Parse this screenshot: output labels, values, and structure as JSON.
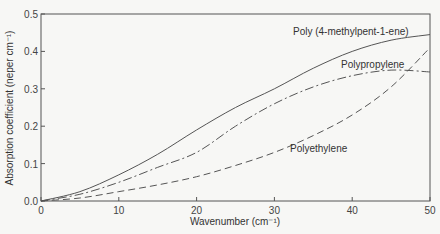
{
  "chart_data": {
    "type": "line",
    "title": "",
    "xlabel": "Wavenumber (cm⁻¹)",
    "ylabel": "Absorption coefficient (neper cm⁻¹)",
    "xlim": [
      0,
      50
    ],
    "ylim": [
      0,
      0.5
    ],
    "xticks": [
      "0",
      "10",
      "20",
      "30",
      "40",
      "50"
    ],
    "yticks": [
      "0.0",
      "0.1",
      "0.2",
      "0.3",
      "0.4",
      "0.5"
    ],
    "grid": false,
    "x": [
      0,
      5,
      10,
      15,
      20,
      25,
      30,
      35,
      40,
      45,
      50
    ],
    "series": [
      {
        "name": "Poly (4-methylpent-1-ene)",
        "style": "solid",
        "values": [
          0,
          0.025,
          0.07,
          0.125,
          0.19,
          0.25,
          0.3,
          0.355,
          0.4,
          0.43,
          0.445
        ]
      },
      {
        "name": "Polypropylene",
        "style": "dash-dot",
        "values": [
          0,
          0.018,
          0.05,
          0.09,
          0.13,
          0.2,
          0.26,
          0.305,
          0.335,
          0.35,
          0.345
        ]
      },
      {
        "name": "Polyethylene",
        "style": "dashed",
        "values": [
          0,
          0.008,
          0.025,
          0.043,
          0.065,
          0.095,
          0.13,
          0.175,
          0.23,
          0.305,
          0.41
        ]
      }
    ],
    "annotations": [
      "Poly (4-methylpent-1-ene)",
      "Polypropylene",
      "Polyethylene"
    ]
  }
}
